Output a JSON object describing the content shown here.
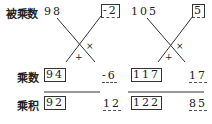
{
  "labels": {
    "multiplicand": "被乘数",
    "multiplier": "乘数",
    "product": "乘积"
  },
  "left": {
    "multiplicand": "98",
    "multiplicand_complement": "-2",
    "multiplier": "94",
    "multiplier_complement": "-6",
    "product_front": "92",
    "product_back": "12",
    "cross_times": "×",
    "cross_plus": "+"
  },
  "right": {
    "multiplicand": "105",
    "multiplicand_complement": "5",
    "multiplier": "117",
    "multiplier_complement": "17",
    "product_front": "122",
    "product_back": "85",
    "cross_times": "×",
    "cross_plus": "+"
  }
}
